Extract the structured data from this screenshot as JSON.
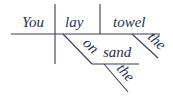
{
  "diagram": {
    "type": "sentence-diagram",
    "subject": "You",
    "verb": "lay",
    "object": "towel",
    "object_modifier": "the",
    "preposition": "on",
    "prep_object": "sand",
    "prep_object_modifier": "the"
  },
  "colors": {
    "text": "#2a2f55",
    "line": "#3a3d55",
    "background": "#ffffff"
  }
}
